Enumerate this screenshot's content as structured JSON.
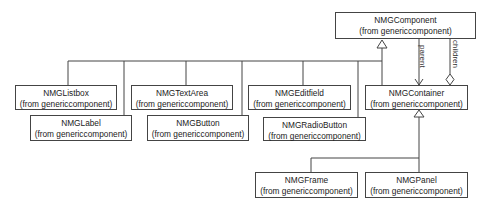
{
  "diagram": {
    "type": "uml-class-diagram",
    "classes": [
      {
        "id": "component",
        "name": "NMGComponent",
        "package": "(from genericcomponent)"
      },
      {
        "id": "listbox",
        "name": "NMGListbox",
        "package": "(from genericcomponent)"
      },
      {
        "id": "label",
        "name": "NMGLabel",
        "package": "(from genericcomponent)"
      },
      {
        "id": "textarea",
        "name": "NMGTextArea",
        "package": "(from genericcomponent)"
      },
      {
        "id": "button",
        "name": "NMGButton",
        "package": "(from genericcomponent)"
      },
      {
        "id": "editfield",
        "name": "NMGEditfield",
        "package": "(from genericcomponent)"
      },
      {
        "id": "radiobutton",
        "name": "NMGRadioButton",
        "package": "(from genericcomponent)"
      },
      {
        "id": "container",
        "name": "NMGContainer",
        "package": "(from genericcomponent)"
      },
      {
        "id": "frame",
        "name": "NMGFrame",
        "package": "(from genericcomponent)"
      },
      {
        "id": "panel",
        "name": "NMGPanel",
        "package": "(from genericcomponent)"
      }
    ],
    "roles": {
      "parent": "parent",
      "children": "children"
    },
    "relations": [
      {
        "type": "generalization",
        "from": "listbox",
        "to": "component"
      },
      {
        "type": "generalization",
        "from": "label",
        "to": "component"
      },
      {
        "type": "generalization",
        "from": "textarea",
        "to": "component"
      },
      {
        "type": "generalization",
        "from": "button",
        "to": "component"
      },
      {
        "type": "generalization",
        "from": "editfield",
        "to": "component"
      },
      {
        "type": "generalization",
        "from": "radiobutton",
        "to": "component"
      },
      {
        "type": "generalization",
        "from": "container",
        "to": "component"
      },
      {
        "type": "association",
        "from": "component",
        "to": "container",
        "role": "parent"
      },
      {
        "type": "aggregation",
        "from": "container",
        "to": "component",
        "role": "children"
      },
      {
        "type": "generalization",
        "from": "frame",
        "to": "container"
      },
      {
        "type": "generalization",
        "from": "panel",
        "to": "container"
      }
    ]
  }
}
